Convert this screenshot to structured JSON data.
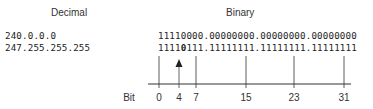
{
  "headers": {
    "decimal": "Decimal",
    "binary": "Binary"
  },
  "rows": [
    {
      "decimal": "240.0.0.0",
      "binary_pre": "1111",
      "binary_hl": "0",
      "binary_post": "000.00000000.00000000.00000000",
      "highlight_bold": false
    },
    {
      "decimal": "247.255.255.255",
      "binary_pre": "1111",
      "binary_hl": "0",
      "binary_post": "111.11111111.11111111.11111111",
      "highlight_bold": true
    }
  ],
  "axis": {
    "label": "Bit",
    "ticks": [
      "0",
      "4",
      "7",
      "15",
      "23",
      "31"
    ],
    "arrow_at_bit": "4"
  }
}
